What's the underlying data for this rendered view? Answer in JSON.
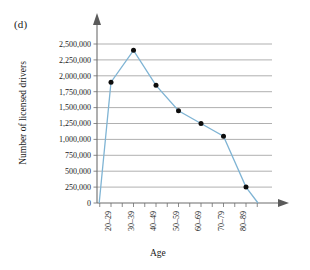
{
  "figure": {
    "panel_label": "(d)"
  },
  "chart_data": {
    "type": "line",
    "title": "",
    "xlabel": "Age",
    "ylabel": "Number of licensed drivers",
    "categories": [
      "20–29",
      "30–39",
      "40–49",
      "50–59",
      "60–69",
      "70–79",
      "80–89"
    ],
    "values": [
      1900000,
      2400000,
      1850000,
      1450000,
      1250000,
      1050000,
      250000
    ],
    "ylim": [
      0,
      2500000
    ],
    "ytick_values": [
      0,
      250000,
      500000,
      750000,
      1000000,
      1250000,
      1500000,
      1750000,
      2000000,
      2250000,
      2500000
    ],
    "ytick_labels": [
      "0",
      "250,000",
      "500,000",
      "750,000",
      "1,000,000",
      "1,250,000",
      "1,500,000",
      "1,750,000",
      "2,000,000",
      "2,250,000",
      "2,500,000"
    ],
    "grid": true,
    "legend": "none",
    "line_color": "#7fb4d4",
    "marker_color": "#0d0d0d",
    "grid_color": "#8e8e8e",
    "axis_color": "#6d6d6d"
  }
}
